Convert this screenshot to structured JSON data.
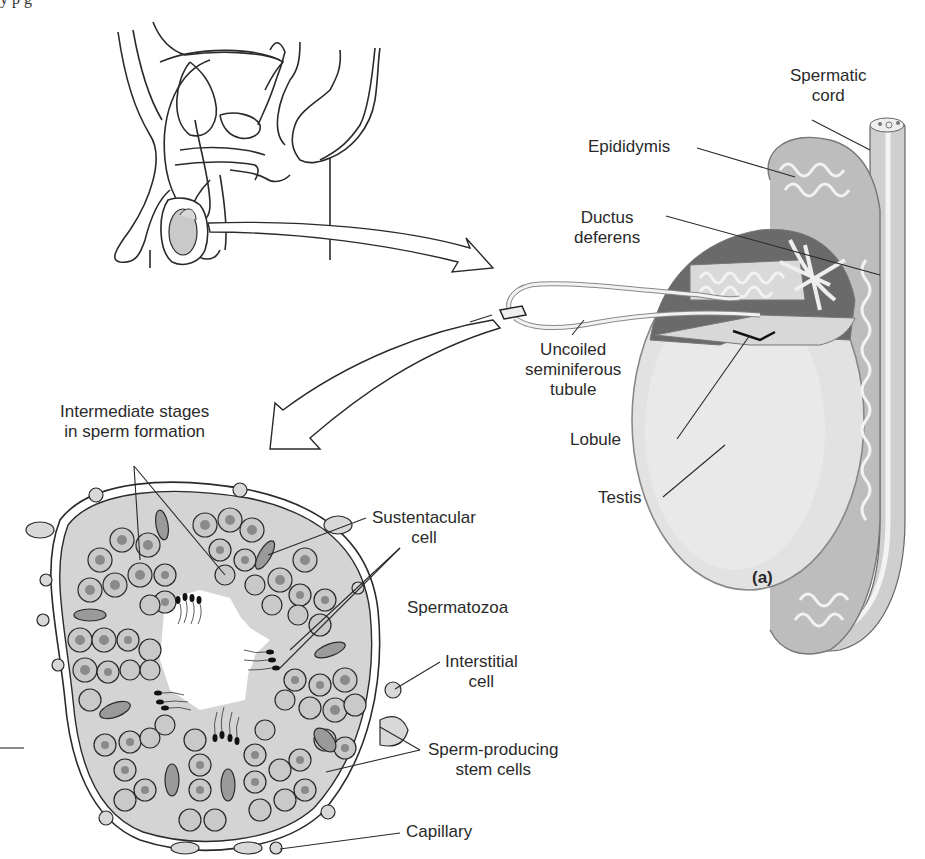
{
  "figure": {
    "panel_label": "(a)",
    "top_cutoff_text": "y p g"
  },
  "labels": {
    "spermatic_cord": [
      "Spermatic",
      "cord"
    ],
    "epididymis": "Epididymis",
    "ductus_deferens": [
      "Ductus",
      "deferens"
    ],
    "uncoiled_tubule": [
      "Uncoiled",
      "seminiferous",
      "tubule"
    ],
    "lobule": "Lobule",
    "testis": "Testis",
    "intermediate_stages": [
      "Intermediate stages",
      "in sperm formation"
    ],
    "sustentacular_cell": [
      "Sustentacular",
      "cell"
    ],
    "spermatozoa": "Spermatozoa",
    "interstitial_cell": [
      "Interstitial",
      "cell"
    ],
    "stem_cells": [
      "Sperm-producing",
      "stem cells"
    ],
    "capillary": "Capillary"
  },
  "colors": {
    "line": "#2a2a2a",
    "tissue_fill": "#d4d4d4",
    "cell_fill": "#c8c8c8",
    "nucleus_fill": "#8a8a8a",
    "testis_fill": "#e0e0e0",
    "dark_fill": "#555555"
  }
}
